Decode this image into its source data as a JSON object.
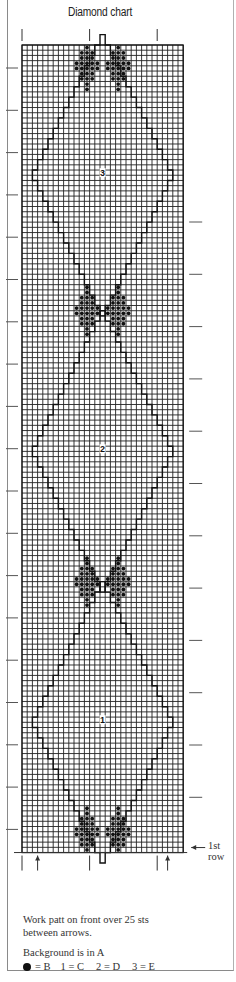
{
  "chart_data": {
    "type": "knitting-chart",
    "title": "Diamond chart",
    "grid": {
      "columns": 31,
      "rows": 155
    },
    "stitch_repeat_between_arrows": 25,
    "first_row_label": "1st row",
    "diamonds": [
      {
        "label": "3",
        "color_key": "E",
        "center_row": 130
      },
      {
        "label": "2",
        "color_key": "D",
        "center_row": 77
      },
      {
        "label": "1",
        "color_key": "C",
        "center_row": 25
      }
    ],
    "motifs": [
      {
        "type": "dot-motif",
        "color_key": "B",
        "position": "top",
        "center_row": 150
      },
      {
        "type": "dot-motif",
        "color_key": "B",
        "position": "upper-middle",
        "center_row": 103
      },
      {
        "type": "dot-motif",
        "color_key": "B",
        "position": "lower-middle",
        "center_row": 51
      },
      {
        "type": "dot-motif",
        "color_key": "B",
        "position": "bottom",
        "center_row": 3
      }
    ],
    "legend": [
      {
        "symbol": "●",
        "means": "B"
      },
      {
        "symbol": "1",
        "means": "C"
      },
      {
        "symbol": "2",
        "means": "D"
      },
      {
        "symbol": "3",
        "means": "E"
      }
    ],
    "background_color_key": "A"
  },
  "header": {
    "title": "Diamond chart"
  },
  "chart": {
    "first_row_label_line1": "1st",
    "first_row_label_line2": "row",
    "diamond_labels": [
      "3",
      "2",
      "1"
    ]
  },
  "notes": {
    "line1": "Work patt on front over 25 sts",
    "line2": "between arrows.",
    "background": "Background is in A"
  },
  "legend": {
    "b": "= B",
    "c": "1 = C",
    "d": "2 = D",
    "e": "3 = E"
  },
  "colors": {
    "ink": "#1a1a1a",
    "grid": "#222222",
    "paper": "#ffffff",
    "frame": "#8a8a8a"
  }
}
